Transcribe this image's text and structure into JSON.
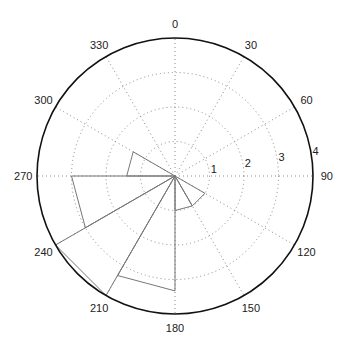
{
  "chart_data": {
    "type": "rose",
    "title": "",
    "angle_convention": "clockwise from north (0 at top), degrees",
    "rlim": [
      0,
      4
    ],
    "radial_ticks": [
      1,
      2,
      3,
      4
    ],
    "radial_tick_labels": [
      "1",
      "2",
      "3",
      "4"
    ],
    "angular_ticks": [
      0,
      30,
      60,
      90,
      120,
      150,
      180,
      210,
      240,
      270,
      300,
      330
    ],
    "angular_tick_labels": [
      "0",
      "30",
      "60",
      "90",
      "120",
      "150",
      "180",
      "210",
      "240",
      "270",
      "300",
      "330"
    ],
    "grid": true,
    "bins": [
      {
        "start": 120,
        "end": 150,
        "value": 1.0
      },
      {
        "start": 150,
        "end": 180,
        "value": 1.0
      },
      {
        "start": 180,
        "end": 210,
        "value": 3.33
      },
      {
        "start": 210,
        "end": 240,
        "value": 4.0
      },
      {
        "start": 240,
        "end": 270,
        "value": 3.0
      },
      {
        "start": 270,
        "end": 300,
        "value": 1.4
      }
    ],
    "colors": {
      "outline": "#111111",
      "grid": "#8a8a8a",
      "petal": "#777777"
    }
  }
}
